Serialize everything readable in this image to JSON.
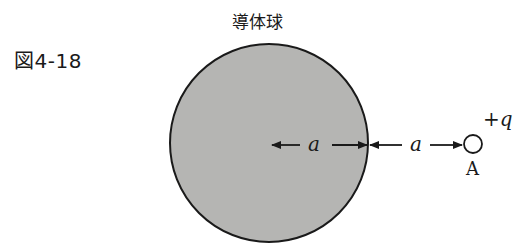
{
  "figure": {
    "label": "図4-18",
    "sphere_label": "導体球",
    "sphere_radius_label": "a",
    "gap_label": "a",
    "charge_label": "+q",
    "point_label": "A"
  },
  "colors": {
    "sphere_fill": "#b5b5b3",
    "stroke": "#1a1a1a",
    "background": "#ffffff"
  }
}
